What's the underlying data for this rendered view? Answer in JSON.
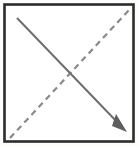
{
  "canvas": {
    "width": 139,
    "height": 147,
    "background_color": "#fdfdfc",
    "title": "Paper fold step diagram"
  },
  "diagram": {
    "type": "origami-fold-step",
    "shapes": {
      "square_frame": {
        "name": "paper-square-outline",
        "x": 4.5,
        "y": 4.5,
        "width": 129,
        "height": 137,
        "stroke_color": "#2b2b2b",
        "stroke_width": 2.6,
        "fill": "none"
      },
      "fold_crease_line": {
        "name": "dashed-crease-diagonal",
        "x1": 10,
        "y1": 138,
        "x2": 130,
        "y2": 9,
        "stroke_color": "#8a8a8a",
        "stroke_width": 2.2,
        "dash_length": 6,
        "gap_length": 4.5,
        "style": "dashed",
        "direction": "bottom-left-to-top-right"
      },
      "fold_arrow_line": {
        "name": "solid-fold-arrow",
        "x1": 17,
        "y1": 18,
        "x2": 120,
        "y2": 125,
        "stroke_color": "#6e6e6e",
        "stroke_width": 2.0,
        "style": "solid",
        "direction": "top-left-to-bottom-right"
      },
      "arrow_head": {
        "name": "arrowhead-triangle",
        "tip_x": 127,
        "tip_y": 132,
        "fill_color": "#5e5e5e",
        "points": "127,132 112,126 116,114",
        "direction": "down-right"
      }
    }
  },
  "colors": {
    "frame_stroke": "#2b2b2b",
    "dashed_line": "#8a8a8a",
    "solid_arrow": "#6e6e6e",
    "arrowhead_fill": "#5e5e5e",
    "background": "#fdfdfc"
  }
}
